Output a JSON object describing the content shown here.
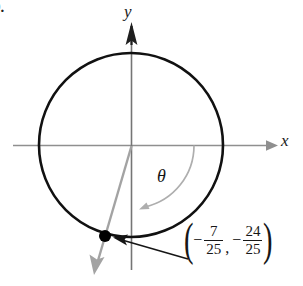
{
  "figure": {
    "problem_number": "9.",
    "type": "unit-circle-diagram",
    "axes": {
      "x_label": "x",
      "y_label": "y",
      "x_axis_color": "#8f8f8f",
      "y_axis_color": "#6d6d6d"
    },
    "circle": {
      "color": "#111111",
      "center_px": [
        131,
        145
      ],
      "radius_px": 92
    },
    "angle": {
      "symbol": "θ",
      "arc_color": "#a8a8a8",
      "ray_color": "#a0a0a0"
    },
    "point": {
      "color": "#000000",
      "position_px": [
        105,
        236
      ],
      "label": {
        "open_paren": "(",
        "close_paren": ")",
        "x": {
          "sign": "−",
          "numerator": "7",
          "denominator": "25"
        },
        "separator": ",",
        "y": {
          "sign": "−",
          "numerator": "24",
          "denominator": "25"
        }
      },
      "pointer_color": "#151515"
    }
  }
}
